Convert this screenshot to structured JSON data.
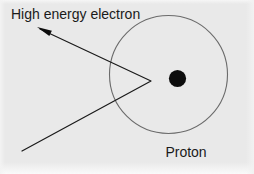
{
  "figure": {
    "background_color": "#e9e9e9",
    "ink_color": "#1a1a1a",
    "circle_stroke_color": "#6b6b6b",
    "width": 254,
    "height": 174
  },
  "labels": {
    "electron_label": "High energy electron",
    "proton_label": "Proton"
  },
  "elements": {
    "proton_cloud": {
      "name": "proton-charge-cloud-circle",
      "center_x": 168.5,
      "center_y": 74.5,
      "radius": 59,
      "stroke_width": 1.1,
      "fill": "none"
    },
    "proton_core": {
      "name": "proton-nucleus-dot",
      "center_x": 177.5,
      "center_y": 78.5,
      "radius": 8.6,
      "fill": "#0d0d0d"
    },
    "trajectory": {
      "name": "electron-trajectory-path",
      "incoming_start_x": 22,
      "incoming_start_y": 151,
      "vertex_x": 151,
      "vertex_y": 81,
      "outgoing_end_x": 40,
      "outgoing_end_y": 29,
      "stroke_width": 1.2
    },
    "arrowhead": {
      "name": "trajectory-arrowhead",
      "tip_x": 37,
      "tip_y": 27,
      "length": 15,
      "fill": "#0d0d0d"
    },
    "electron_label_position": {
      "x": 11,
      "y": 19
    },
    "proton_label_position": {
      "x": 186,
      "y": 157
    }
  }
}
